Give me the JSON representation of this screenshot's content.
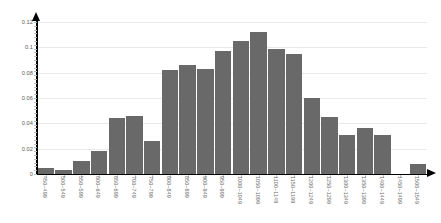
{
  "chart_data": {
    "type": "bar",
    "title": "",
    "subtitle": "",
    "xlabel": "",
    "ylabel": "",
    "grid": true,
    "legend": false,
    "legend_position": "none",
    "bar_color": "#696969",
    "axis_color": "#000000",
    "gridline_color": "#e9e9e9",
    "background_color": "#ffffff",
    "xlim": [
      0,
      22
    ],
    "ylim": [
      0,
      0.12
    ],
    "ytick_labels": [
      "0.12",
      "0.1",
      "0.08",
      "0.06",
      "0.04",
      "0.02",
      "0"
    ],
    "ytick_values": [
      0.12,
      0.1,
      0.08,
      0.06,
      0.04,
      0.02,
      0
    ],
    "categories": [
      "450~499",
      "500~549",
      "550~599",
      "600~649",
      "650~699",
      "700~749",
      "750~799",
      "800~849",
      "850~899",
      "900~949",
      "950~999",
      "1000~1049",
      "1050~1099",
      "1100~1149",
      "1150~1199",
      "1200~1249",
      "1250~1299",
      "1300~1349",
      "1350~1399",
      "1400~1449",
      "1450~1499",
      "1500~1549"
    ],
    "values": [
      0.005,
      0.003,
      0.01,
      0.018,
      0.044,
      0.046,
      0.026,
      0.082,
      0.086,
      0.083,
      0.097,
      0.105,
      0.112,
      0.099,
      0.095,
      0.06,
      0.045,
      0.031,
      0.036,
      0.031,
      0.0,
      0.008
    ]
  }
}
